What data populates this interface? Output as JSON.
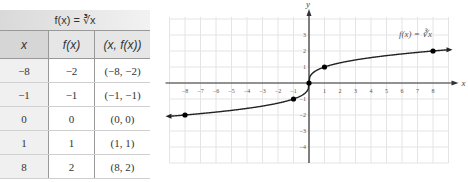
{
  "table": {
    "title": "f(x) = ∛x",
    "headers": [
      "x",
      "f(x)",
      "(x, f(x))"
    ],
    "rows": [
      [
        "−8",
        "−2",
        "(−8, −2)"
      ],
      [
        "−1",
        "−1",
        "(−1, −1)"
      ],
      [
        "0",
        "0",
        "(0, 0)"
      ],
      [
        "1",
        "1",
        "(1, 1)"
      ],
      [
        "8",
        "2",
        "(8, 2)"
      ]
    ]
  },
  "chart_data": {
    "type": "line",
    "title": "",
    "function_label": "f(x) = ∛x",
    "xlabel": "x",
    "ylabel": "y",
    "xlim": [
      -9,
      9
    ],
    "ylim": [
      -5,
      4
    ],
    "xticks": [
      -8,
      -7,
      -6,
      -5,
      -4,
      -3,
      -2,
      -1,
      1,
      2,
      3,
      4,
      5,
      6,
      7,
      8
    ],
    "yticks": [
      -4,
      -3,
      -2,
      -1,
      1,
      2,
      3
    ],
    "grid": true,
    "series": [
      {
        "name": "f(x) = ∛x",
        "curve": "cube root",
        "x_range": [
          -9,
          9
        ]
      }
    ],
    "points": [
      {
        "x": -8,
        "y": -2
      },
      {
        "x": -1,
        "y": -1
      },
      {
        "x": 0,
        "y": 0
      },
      {
        "x": 1,
        "y": 1
      },
      {
        "x": 8,
        "y": 2
      }
    ],
    "colors": {
      "curve": "#222222",
      "grid": "#e4e4e4",
      "axis": "#333333"
    }
  }
}
